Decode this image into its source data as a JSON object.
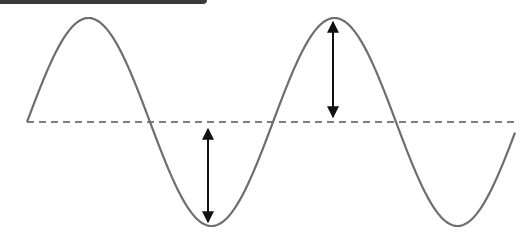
{
  "diagram": {
    "type": "sine-wave-amplitude",
    "colors": {
      "wave": "#6e6e6e",
      "baseline": "#555555",
      "arrow": "#111111",
      "top_bar": "#3a3a3a"
    },
    "wave": {
      "x_start": 27,
      "x_end": 515,
      "baseline_y": 122,
      "amplitude": 104,
      "period": 246,
      "peaks_x": [
        87,
        333
      ],
      "troughs_x": [
        208,
        455
      ]
    },
    "baseline": {
      "style": "dashed",
      "x1": 27,
      "x2": 515,
      "y": 122
    },
    "arrows": [
      {
        "name": "positive-amplitude-arrow",
        "x": 333,
        "y1": 18,
        "y2": 121
      },
      {
        "name": "negative-amplitude-arrow",
        "x": 208,
        "y1": 125,
        "y2": 226
      }
    ]
  }
}
